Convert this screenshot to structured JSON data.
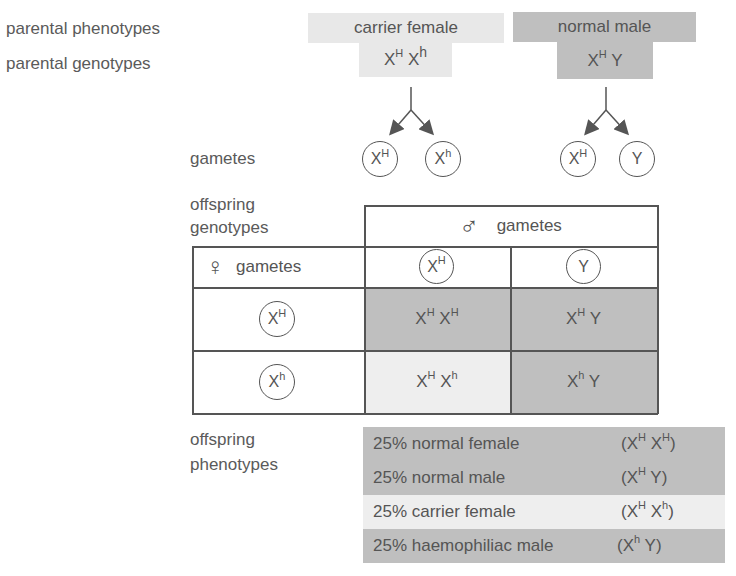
{
  "row_labels": {
    "parental_phenotypes": "parental phenotypes",
    "parental_genotypes": "parental genotypes",
    "gametes": "gametes",
    "offspring_genotypes_line1": "offspring",
    "offspring_genotypes_line2": "genotypes",
    "offspring_phenotypes_line1": "offspring",
    "offspring_phenotypes_line2": "phenotypes"
  },
  "parents": {
    "female": {
      "phenotype": "carrier female",
      "genotype": [
        {
          "base": "X",
          "sup": "H"
        },
        {
          "base": " X",
          "sup": "h"
        }
      ],
      "gametes": [
        {
          "base": "X",
          "sup": "H"
        },
        {
          "base": "X",
          "sup": "h"
        }
      ]
    },
    "male": {
      "phenotype": "normal male",
      "genotype": [
        {
          "base": "X",
          "sup": "H"
        },
        {
          "base": " Y",
          "sup": ""
        }
      ],
      "gametes": [
        {
          "base": "X",
          "sup": "H"
        },
        {
          "base": "Y",
          "sup": ""
        }
      ]
    }
  },
  "punnett": {
    "male_header_symbol": "♂",
    "male_header_label": "gametes",
    "female_header_symbol": "♀",
    "female_header_label": "gametes",
    "columns": [
      {
        "base": "X",
        "sup": "H"
      },
      {
        "base": "Y",
        "sup": ""
      }
    ],
    "rows": [
      {
        "gamete": {
          "base": "X",
          "sup": "H"
        },
        "cells": [
          {
            "text": [
              {
                "base": "X",
                "sup": "H"
              },
              {
                "base": " X",
                "sup": "H"
              }
            ],
            "shade": "dark"
          },
          {
            "text": [
              {
                "base": "X",
                "sup": "H"
              },
              {
                "base": " Y",
                "sup": ""
              }
            ],
            "shade": "dark"
          }
        ]
      },
      {
        "gamete": {
          "base": "X",
          "sup": "h"
        },
        "cells": [
          {
            "text": [
              {
                "base": "X",
                "sup": "H"
              },
              {
                "base": " X",
                "sup": "h"
              }
            ],
            "shade": "light"
          },
          {
            "text": [
              {
                "base": "X",
                "sup": "h"
              },
              {
                "base": " Y",
                "sup": ""
              }
            ],
            "shade": "dark"
          }
        ]
      }
    ]
  },
  "offspring_phenotypes": [
    {
      "label": "25% normal female",
      "genotype": "(X^H X^H)",
      "shade": "dark"
    },
    {
      "label": "25% normal male",
      "genotype": "(X^H Y)",
      "shade": "dark"
    },
    {
      "label": "25% carrier female",
      "genotype": "(X^H X^h)",
      "shade": "light"
    },
    {
      "label": "25% haemophiliac male",
      "genotype": "(X^h Y)",
      "shade": "dark"
    }
  ],
  "colors": {
    "light_shade": "#eeeeee",
    "dark_shade": "#bfbfbf",
    "text": "#555555",
    "line": "#555555"
  }
}
